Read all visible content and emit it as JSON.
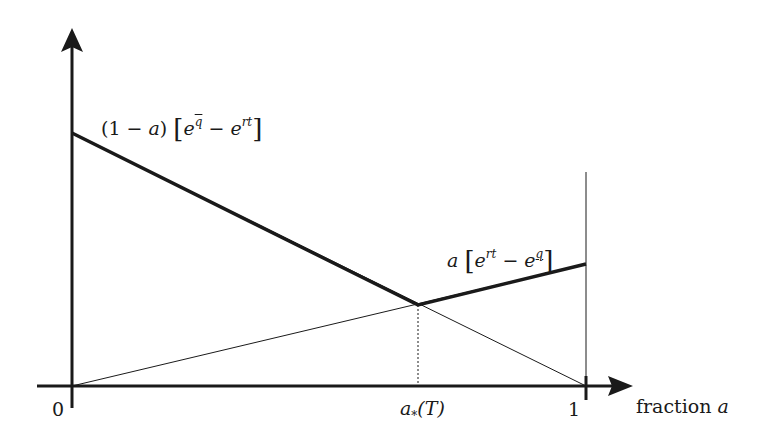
{
  "diagram": {
    "axes": {
      "x_label": "fraction a",
      "x_label_text": "fraction ",
      "x_label_var": "a",
      "ticks": {
        "origin": "0",
        "one": "1",
        "a_star": "a",
        "a_star_sub": "*",
        "a_star_arg": "(T)"
      }
    },
    "curves": {
      "upper_label": {
        "prefix": "(1 − ",
        "var": "a",
        "suffix": ") ",
        "open": "[",
        "e1": "e",
        "e1_exp": "q",
        "minus": " − ",
        "e2": "e",
        "e2_exp": "rt",
        "close": "]"
      },
      "lower_label": {
        "var": "a",
        "open": "[",
        "e1": "e",
        "e1_exp": "rt",
        "minus": " − ",
        "e2": "e",
        "e2_exp": "q",
        "close": "]"
      }
    },
    "colors": {
      "ink": "#1a1a1a",
      "background": "#ffffff"
    }
  }
}
